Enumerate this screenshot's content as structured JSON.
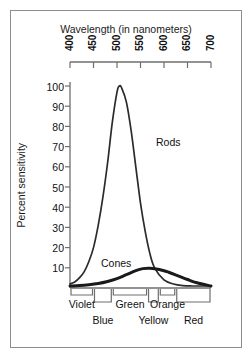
{
  "chart_data": {
    "type": "line",
    "title": "Wavelength (in nanometers)",
    "xlabel": "Wavelength (in nanometers)",
    "ylabel": "Percent sensitivity",
    "xlim": [
      400,
      700
    ],
    "ylim": [
      0,
      105
    ],
    "grid": false,
    "legend": "inline-annotations",
    "xticks": [
      "400",
      "450",
      "500",
      "550",
      "600",
      "650",
      "700"
    ],
    "yticks": [
      "10",
      "20",
      "30",
      "40",
      "50",
      "60",
      "70",
      "80",
      "90",
      "100"
    ],
    "series": [
      {
        "name": "Rods",
        "label": "Rods",
        "style": "thin",
        "color": "#2b2b2b",
        "x": [
          400,
          410,
          420,
          430,
          440,
          450,
          460,
          470,
          480,
          490,
          500,
          505,
          510,
          520,
          530,
          540,
          550,
          560,
          570,
          580,
          600,
          620,
          640,
          660,
          680,
          700
        ],
        "y": [
          2,
          3,
          5,
          8,
          13,
          20,
          31,
          45,
          62,
          82,
          97,
          100,
          99,
          92,
          78,
          60,
          42,
          28,
          17,
          10,
          4,
          2,
          1.2,
          1,
          1,
          1
        ]
      },
      {
        "name": "Cones",
        "label": "Cones",
        "style": "thick",
        "color": "#1a1a1a",
        "x": [
          400,
          420,
          440,
          460,
          480,
          500,
          520,
          540,
          555,
          570,
          590,
          610,
          630,
          650,
          670,
          700
        ],
        "y": [
          1,
          1.2,
          1.6,
          2.2,
          3.2,
          4.6,
          6.6,
          8.6,
          9.6,
          9.8,
          9.2,
          7.8,
          6.0,
          4.2,
          2.6,
          1.0
        ]
      }
    ],
    "annotations": [
      {
        "text": "Rods",
        "x": 560,
        "y": 78
      },
      {
        "text": "Cones",
        "x": 505,
        "y": 16
      }
    ],
    "color_bands": [
      {
        "label": "Violet",
        "row": "upper",
        "start": 400,
        "end": 450
      },
      {
        "label": "Blue",
        "row": "lower",
        "start": 450,
        "end": 490
      },
      {
        "label": "Green",
        "row": "upper",
        "start": 490,
        "end": 565
      },
      {
        "label": "Yellow",
        "row": "lower",
        "start": 565,
        "end": 590
      },
      {
        "label": "Orange",
        "row": "upper",
        "start": 590,
        "end": 625
      },
      {
        "label": "Red",
        "row": "lower",
        "start": 625,
        "end": 700
      }
    ]
  }
}
